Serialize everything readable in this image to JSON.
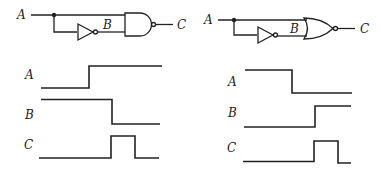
{
  "left_panel": {
    "gate_type": "NAND",
    "circuit_labels": {
      "input": "A",
      "inverted": "B",
      "output": "C"
    },
    "timing_labels": {
      "a": "A",
      "b": "B",
      "c": "C"
    },
    "signals": {
      "A": "low then high",
      "B": "high then low (delayed)",
      "C": "low, short high pulse, low"
    }
  },
  "right_panel": {
    "gate_type": "NOR",
    "circuit_labels": {
      "input": "A",
      "inverted": "B",
      "output": "C"
    },
    "timing_labels": {
      "a": "A",
      "b": "B",
      "c": "C"
    },
    "signals": {
      "A": "high then low",
      "B": "low then high (delayed)",
      "C": "low, short high pulse, low"
    }
  }
}
